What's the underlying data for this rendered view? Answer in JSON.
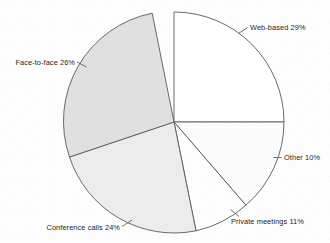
{
  "chart_data": {
    "type": "pie",
    "title": "",
    "subtitle": "",
    "xlabel": "",
    "ylabel": "",
    "grid": false,
    "legend_position": "none",
    "label_style": "external-with-leader-lines",
    "units": "percent",
    "total": 100,
    "start_angle_deg": 0,
    "direction": "clockwise",
    "categories": [
      "Web-based",
      "Other",
      "Private meetings",
      "Conference calls",
      "Face-to-face"
    ],
    "values": [
      29,
      10,
      11,
      24,
      26
    ],
    "slices": [
      {
        "name": "web-based",
        "label": "Web-based 29%",
        "category": "Web-based",
        "value": 29,
        "color": "#ffffff",
        "path": "M 174 122 L 174 12 A 110 110 0 0 1 284 122 L 174 122 Z",
        "leader": "M 238.5 33.5 L 247.5 27.5",
        "label_x": 250,
        "label_y": 30,
        "anchor": "start"
      },
      {
        "name": "other",
        "label": "Other 10%",
        "category": "Other",
        "value": 10,
        "color": "#fbfbfb",
        "path": "M 174 122 L 284 122 A 110 110 0 0 1 245.9 205.2 L 174 122 Z",
        "leader": "M 273.5 157.5 L 281.5 157.5",
        "label_x": 284,
        "label_y": 160,
        "anchor": "start"
      },
      {
        "name": "private-meetings",
        "label": "Private meetings 11%",
        "category": "Private meetings",
        "value": 11,
        "color": "#fdfdfd",
        "path": "M 174 122 L 245.9 205.2 A 110 110 0 0 1 196.0 230.8 L 174 122 Z",
        "leader": "M 230.5 209.5 L 239.0 216.5",
        "label_x": 231,
        "label_y": 224,
        "anchor": "start"
      },
      {
        "name": "conference-calls",
        "label": "Conference calls 24%",
        "category": "Conference calls",
        "value": 24,
        "color": "#ececec",
        "path": "M 174 122 L 196.0 230.8 A 110 110 0 0 1 69.5 157.0 L 174 122 Z",
        "leader": "M 132.0 220.0 L 122.0 226.5",
        "label_x": 120,
        "label_y": 230,
        "anchor": "end"
      },
      {
        "name": "face-to-face",
        "label": "Face-to-face 26%",
        "category": "Face-to-face",
        "value": 26,
        "color": "#e0e0e0",
        "path": "M 174 122 L 69.5 157.0 A 110 110 0 0 1 152.2 13.2 L 174 122 Z",
        "leader": "M 86.5 67.0 L 77.0 62.0",
        "label_x": 75,
        "label_y": 65,
        "anchor": "end"
      }
    ],
    "geometry": {
      "center_x": 174,
      "center_y": 122,
      "radius": 110
    },
    "style": {
      "outline_color": "#595959",
      "background": "#fdfdfd",
      "text_color": "#1d1d1d"
    }
  }
}
